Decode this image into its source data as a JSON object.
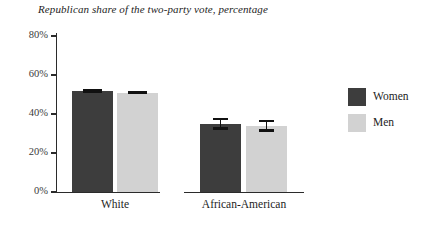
{
  "chart_data": {
    "type": "bar",
    "title": "Republican share of the two-party vote, percentage",
    "xlabel": "",
    "ylabel": "",
    "categories": [
      "White",
      "African-American"
    ],
    "series": [
      {
        "name": "Women",
        "color": "#3d3d3d",
        "values": [
          52,
          35
        ],
        "errors": [
          1,
          3
        ]
      },
      {
        "name": "Men",
        "color": "#d2d2d2",
        "values": [
          51,
          34
        ],
        "errors": [
          1,
          3
        ]
      }
    ],
    "ylim": [
      0,
      80
    ],
    "yticks": [
      0,
      20,
      40,
      60,
      80
    ],
    "ytick_labels": [
      "0%",
      "20%",
      "40%",
      "60%",
      "80%"
    ],
    "grid": false,
    "legend_position": "right",
    "errorbar_color": "#111111"
  },
  "legend": {
    "items": [
      {
        "label": "Women",
        "color": "#3d3d3d"
      },
      {
        "label": "Men",
        "color": "#d2d2d2"
      }
    ]
  }
}
